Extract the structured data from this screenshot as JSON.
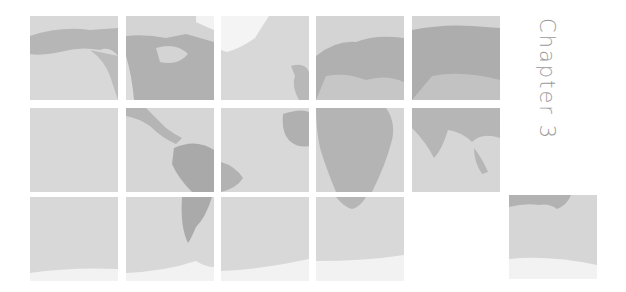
{
  "chapter_label": "Chapter 3",
  "colors": {
    "ocean": "#d6d6d6",
    "land": "#b3b3b3",
    "ice": "#f1f1f1",
    "text": "#9a9a9a"
  },
  "tiles": [
    {
      "row": 1,
      "col": 1,
      "region": "north-pacific-alaska"
    },
    {
      "row": 1,
      "col": 2,
      "region": "north-america-canada"
    },
    {
      "row": 1,
      "col": 3,
      "region": "greenland-north-atlantic"
    },
    {
      "row": 1,
      "col": 4,
      "region": "europe-west-russia"
    },
    {
      "row": 1,
      "col": 5,
      "region": "siberia-central-asia"
    },
    {
      "row": 2,
      "col": 1,
      "region": "central-pacific"
    },
    {
      "row": 2,
      "col": 2,
      "region": "central-america-south-america-north"
    },
    {
      "row": 2,
      "col": 3,
      "region": "atlantic-west-africa"
    },
    {
      "row": 2,
      "col": 4,
      "region": "africa"
    },
    {
      "row": 2,
      "col": 5,
      "region": "india-southeast-asia"
    },
    {
      "row": 3,
      "col": 1,
      "region": "south-pacific-antarctica"
    },
    {
      "row": 3,
      "col": 2,
      "region": "south-america-south-antarctica"
    },
    {
      "row": 3,
      "col": 3,
      "region": "south-atlantic-antarctica"
    },
    {
      "row": 3,
      "col": 4,
      "region": "southern-africa-antarctica"
    },
    {
      "row": 3,
      "col": 6,
      "region": "australia-antarctica"
    }
  ]
}
